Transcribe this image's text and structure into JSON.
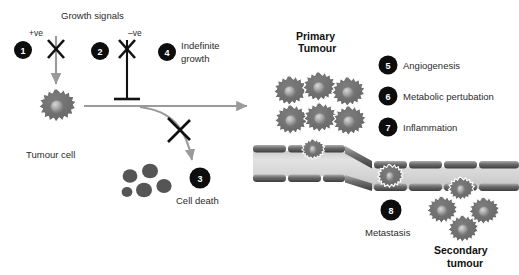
{
  "figure": {
    "background_color": "#ffffff"
  },
  "colors": {
    "badge_fill": "#0d0d0d",
    "badge_text": "#ffffff",
    "cell_body": "#6e6e6e",
    "cell_body_dark": "#5a5a5a",
    "cell_outline": "#ffffff",
    "nucleus": "#9a9a9a",
    "arrow_gray": "#9a9a9a",
    "cross_black": "#111111",
    "vessel_lumen": "#d9d9d9",
    "vessel_wall": "#8c8c8c",
    "apoptotic_dot": "#555555",
    "text": "#2b2b2b"
  },
  "labels": {
    "growth_signals": "Growth signals",
    "positive_ve": "+ve",
    "negative_ve": "–ve",
    "indefinite_growth_line1": "Indefinite",
    "indefinite_growth_line2": "growth",
    "tumour_cell": "Tumour cell",
    "cell_death": "Cell death",
    "primary_tumour_line1": "Primary",
    "primary_tumour_line2": "Tumour",
    "metastasis": "Metastasis",
    "secondary_tumour_line1": "Secondary",
    "secondary_tumour_line2": "tumour"
  },
  "steps": [
    {
      "number": "1",
      "label": "+ve growth signals",
      "caption": ""
    },
    {
      "number": "2",
      "label": "–ve growth signals",
      "caption": ""
    },
    {
      "number": "3",
      "label": "Cell death",
      "caption": "Cell death"
    },
    {
      "number": "4",
      "label": "Indefinite growth",
      "caption": "Indefinite growth"
    },
    {
      "number": "5",
      "label": "Angiogenesis",
      "caption": "Angiogenesis"
    },
    {
      "number": "6",
      "label": "Metabolic pertubation",
      "caption": "Metabolic pertubation"
    },
    {
      "number": "7",
      "label": "Inflammation",
      "caption": "Inflammation"
    },
    {
      "number": "8",
      "label": "Metastasis",
      "caption": "Metastasis"
    }
  ],
  "legend": {
    "items": [
      {
        "number": "5",
        "text": "Angiogenesis"
      },
      {
        "number": "6",
        "text": "Metabolic pertubation"
      },
      {
        "number": "7",
        "text": "Inflammation"
      }
    ]
  },
  "cell_counts": {
    "primary_tumour_cluster": 6,
    "intravasating_cell": 1,
    "circulating_cell": 1,
    "secondary_tumour_cluster": 4,
    "apoptotic_bodies": 5,
    "single_tumour_cell": 1
  }
}
